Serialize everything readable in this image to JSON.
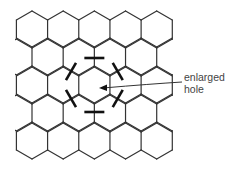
{
  "diagram": {
    "type": "hexagonal-lattice",
    "rows": 5,
    "hexagons_per_full_row": 5,
    "line_color": "#333333",
    "marker_color": "#111111",
    "background": "#ffffff",
    "removed_bond_markers": 6,
    "annotation": {
      "line1": "enlarged",
      "line2": "hole",
      "arrow_target": "center of enlarged hole"
    }
  }
}
